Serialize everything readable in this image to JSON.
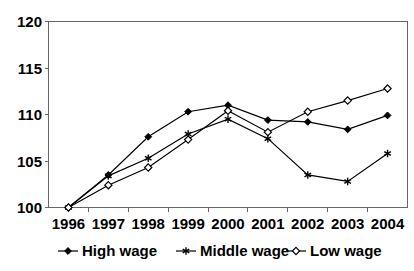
{
  "chart_data": {
    "type": "line",
    "title": "",
    "subtitle": "",
    "xlabel": "",
    "ylabel": "",
    "categories": [
      "1996",
      "1997",
      "1998",
      "1999",
      "2000",
      "2001",
      "2002",
      "2003",
      "2004"
    ],
    "ylim": [
      100,
      120
    ],
    "yticks": [
      100,
      105,
      110,
      115,
      120
    ],
    "ytick_labels": [
      "100",
      "105",
      "110",
      "115",
      "120"
    ],
    "grid": false,
    "legend_position": "bottom",
    "series": [
      {
        "name": "High wage",
        "marker": "filled-diamond",
        "color": "#000000",
        "values": [
          100.0,
          103.5,
          107.6,
          110.3,
          111.0,
          109.4,
          109.2,
          108.4,
          109.9
        ]
      },
      {
        "name": "Middle wage",
        "marker": "asterisk",
        "color": "#000000",
        "values": [
          100.0,
          103.4,
          105.3,
          107.9,
          109.5,
          107.4,
          103.5,
          102.8,
          105.8
        ]
      },
      {
        "name": "Low wage",
        "marker": "open-diamond",
        "color": "#000000",
        "values": [
          100.0,
          102.4,
          104.3,
          107.3,
          110.4,
          108.1,
          110.3,
          111.5,
          112.8
        ]
      }
    ]
  },
  "legend": {
    "items": [
      {
        "label": "High wage",
        "marker": "filled-diamond"
      },
      {
        "label": "Middle wage",
        "marker": "asterisk"
      },
      {
        "label": "Low wage",
        "marker": "open-diamond"
      }
    ]
  },
  "axes": {
    "y_tick_labels": [
      "120",
      "115",
      "110",
      "105",
      "100"
    ],
    "x_tick_labels": [
      "1996",
      "1997",
      "1998",
      "1999",
      "2000",
      "2001",
      "2002",
      "2003",
      "2004"
    ]
  }
}
